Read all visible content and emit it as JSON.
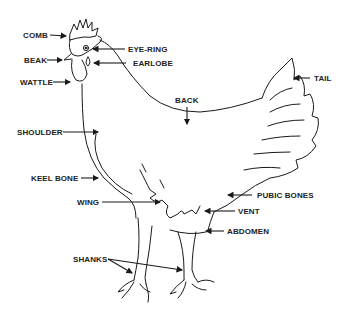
{
  "diagram": {
    "labels": {
      "comb": "COMB",
      "beak": "BEAK",
      "wattle": "WATTLE",
      "eye_ring": "EYE-RING",
      "earlobe": "EARLOBE",
      "back": "BACK",
      "tail": "TAIL",
      "shoulder": "SHOULDER",
      "keel_bone": "KEEL BONE",
      "wing": "WING",
      "pubic_bones": "PUBIC BONES",
      "vent": "VENT",
      "abdomen": "ABDOMEN",
      "shanks": "SHANKS"
    },
    "colors": {
      "line": "#1a1a1a",
      "text": "#222222",
      "background": "#ffffff"
    }
  }
}
